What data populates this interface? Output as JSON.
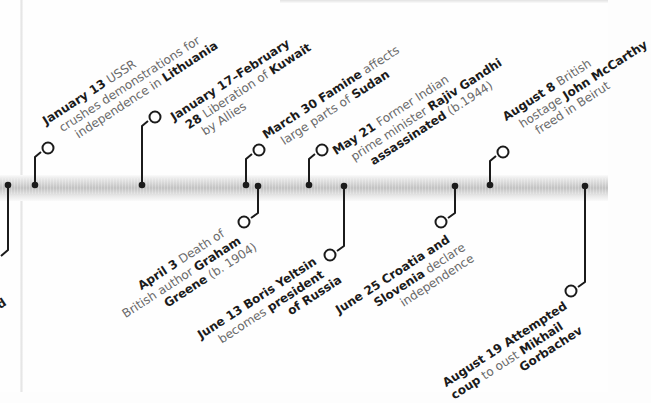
{
  "timeline": {
    "colors": {
      "ink": "#1b1b1b",
      "body_text": "#6a6a6a",
      "band": "#c6c6c6"
    },
    "above": [
      {
        "id": "jan13",
        "lines": [
          [
            {
              "t": "January 13",
              "b": true
            },
            {
              "t": " USSR",
              "b": false
            }
          ],
          [
            {
              "t": "crushes demonstrations for",
              "b": false
            }
          ],
          [
            {
              "t": "independence in ",
              "b": false
            },
            {
              "t": "Lithuania",
              "b": true
            }
          ]
        ]
      },
      {
        "id": "jan17",
        "lines": [
          [
            {
              "t": "January 17–February",
              "b": true
            }
          ],
          [
            {
              "t": "28",
              "b": true
            },
            {
              "t": " Liberation of ",
              "b": false
            },
            {
              "t": "Kuwait",
              "b": true
            }
          ],
          [
            {
              "t": "by Allies",
              "b": false
            }
          ]
        ]
      },
      {
        "id": "mar30",
        "lines": [
          [
            {
              "t": "March 30",
              "b": true
            },
            {
              "t": " Famine",
              "b": true
            },
            {
              "t": " affects",
              "b": false
            }
          ],
          [
            {
              "t": "large parts of ",
              "b": false
            },
            {
              "t": "Sudan",
              "b": true
            }
          ]
        ]
      },
      {
        "id": "may21",
        "lines": [
          [
            {
              "t": "May 21",
              "b": true
            },
            {
              "t": " Former Indian",
              "b": false
            }
          ],
          [
            {
              "t": "prime minister ",
              "b": false
            },
            {
              "t": "Rajiv Gandhi",
              "b": true
            }
          ],
          [
            {
              "t": "assassinated",
              "b": true
            },
            {
              "t": " (b.1944)",
              "b": false
            }
          ]
        ]
      },
      {
        "id": "aug8",
        "lines": [
          [
            {
              "t": "August 8",
              "b": true
            },
            {
              "t": " British",
              "b": false
            }
          ],
          [
            {
              "t": "hostage ",
              "b": false
            },
            {
              "t": "John McCarthy",
              "b": true
            }
          ],
          [
            {
              "t": "freed in Beirut",
              "b": false
            }
          ]
        ]
      }
    ],
    "below": [
      {
        "id": "left_partial",
        "lines": [
          [
            {
              "t": "d",
              "b": true
            }
          ]
        ]
      },
      {
        "id": "apr3",
        "lines": [
          [
            {
              "t": "April 3",
              "b": true
            },
            {
              "t": " Death of",
              "b": false
            }
          ],
          [
            {
              "t": "British author ",
              "b": false
            },
            {
              "t": "Graham",
              "b": true
            }
          ],
          [
            {
              "t": "Greene",
              "b": true
            },
            {
              "t": " (b. 1904)",
              "b": false
            }
          ]
        ]
      },
      {
        "id": "jun13",
        "lines": [
          [
            {
              "t": "June 13",
              "b": true
            },
            {
              "t": " Boris Yeltsin",
              "b": true
            }
          ],
          [
            {
              "t": "becomes ",
              "b": false
            },
            {
              "t": "president",
              "b": true
            }
          ],
          [
            {
              "t": "of Russia",
              "b": true
            }
          ]
        ]
      },
      {
        "id": "jun25",
        "lines": [
          [
            {
              "t": "June 25",
              "b": true
            },
            {
              "t": " Croatia and",
              "b": true
            }
          ],
          [
            {
              "t": "Slovenia",
              "b": true
            },
            {
              "t": " declare",
              "b": false
            }
          ],
          [
            {
              "t": "independence",
              "b": false
            }
          ]
        ]
      },
      {
        "id": "aug19",
        "lines": [
          [
            {
              "t": "August 19",
              "b": true
            },
            {
              "t": " Attempted",
              "b": true
            }
          ],
          [
            {
              "t": "coup",
              "b": true
            },
            {
              "t": " to oust ",
              "b": false
            },
            {
              "t": "Mikhail",
              "b": true
            }
          ],
          [
            {
              "t": "Gorbachev",
              "b": true
            }
          ]
        ]
      }
    ],
    "markers_x": [
      8,
      35,
      142,
      246,
      258,
      309,
      344,
      455,
      490,
      585
    ]
  }
}
